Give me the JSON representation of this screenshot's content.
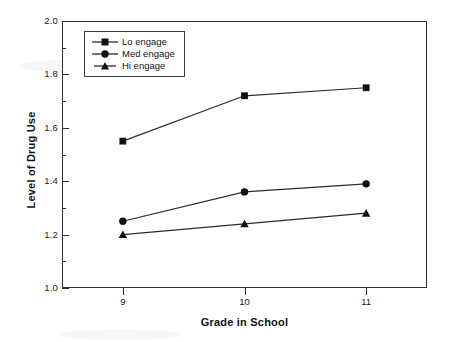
{
  "chart_data": {
    "type": "line",
    "title": "",
    "xlabel": "Grade in School",
    "ylabel": "Level of Drug Use",
    "x": [
      9,
      10,
      11
    ],
    "categories": [
      "9",
      "10",
      "11"
    ],
    "series": [
      {
        "name": "Lo engage",
        "marker": "square",
        "values": [
          1.55,
          1.72,
          1.75
        ]
      },
      {
        "name": "Med engage",
        "marker": "circle",
        "values": [
          1.25,
          1.36,
          1.39
        ]
      },
      {
        "name": "Hi engage",
        "marker": "triangle",
        "values": [
          1.2,
          1.24,
          1.28
        ]
      }
    ],
    "xlim": [
      8.5,
      11.5
    ],
    "ylim": [
      1.0,
      2.0
    ],
    "y_ticks": [
      "2.0",
      "1.8",
      "1.6",
      "1.4",
      "1.2",
      "1.0"
    ],
    "y_tick_values": [
      2.0,
      1.8,
      1.6,
      1.4,
      1.2,
      1.0
    ],
    "y_minor_tick_values": [
      1.9,
      1.7,
      1.5,
      1.3,
      1.1
    ],
    "x_ticks": [
      "9",
      "10",
      "11"
    ],
    "grid": false,
    "legend_position": "top-left",
    "line_color": "#2b2b2b",
    "marker_color": "#111111",
    "frame_color": "#2b2b2b"
  },
  "legend": {
    "entries": [
      {
        "label": "Lo engage"
      },
      {
        "label": "Med engage"
      },
      {
        "label": "Hi engage"
      }
    ]
  },
  "axes": {
    "x_title": "Grade in School",
    "y_title": "Level of Drug Use"
  }
}
